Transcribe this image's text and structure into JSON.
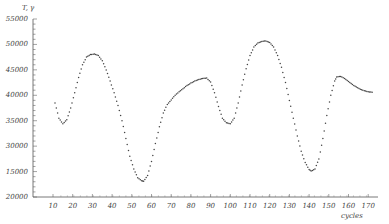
{
  "chart_data": {
    "type": "scatter",
    "title": "",
    "ylabel": "T, γ",
    "xlabel": "cycles",
    "xlim": [
      5,
      175
    ],
    "ylim": [
      20000,
      55000
    ],
    "grid": false,
    "legend": null,
    "x_ticks": [
      10,
      20,
      30,
      40,
      50,
      60,
      70,
      80,
      90,
      100,
      110,
      120,
      130,
      140,
      150,
      160,
      170
    ],
    "y_ticks": [
      20000,
      25000,
      30000,
      35000,
      40000,
      45000,
      50000,
      55000
    ],
    "y_tick_labels": [
      "20000",
      "15000",
      "30000",
      "35000",
      "40000",
      "45000",
      "50000",
      "55000"
    ],
    "series": [
      {
        "name": "observations",
        "marker": "dot",
        "x": [
          11,
          13,
          15,
          17,
          19,
          21,
          23,
          25,
          27,
          29,
          31,
          33,
          35,
          37,
          39,
          41,
          43,
          45,
          47,
          49,
          51,
          53,
          55,
          56,
          58,
          60,
          62,
          64,
          66,
          68,
          70,
          72,
          74,
          76,
          78,
          80,
          82,
          84,
          86,
          88,
          90,
          92,
          94,
          96,
          98,
          100,
          102,
          104,
          106,
          108,
          110,
          112,
          114,
          116,
          118,
          120,
          122,
          124,
          126,
          128,
          130,
          132,
          134,
          136,
          138,
          140,
          141,
          143,
          145,
          147,
          149,
          151,
          153,
          154,
          156,
          158,
          160,
          162,
          164,
          166,
          168,
          170,
          172
        ],
        "y": [
          38500,
          35500,
          34400,
          35200,
          37500,
          40500,
          43500,
          46000,
          47500,
          48000,
          48100,
          47800,
          46800,
          45000,
          42800,
          40500,
          38000,
          35000,
          31500,
          28000,
          25500,
          23800,
          23200,
          23100,
          24200,
          27000,
          30500,
          33800,
          36500,
          38200,
          39100,
          40000,
          40700,
          41300,
          41900,
          42400,
          42800,
          43100,
          43300,
          43400,
          42600,
          40500,
          37800,
          35500,
          34600,
          34400,
          35500,
          38500,
          42000,
          45200,
          47800,
          49500,
          50300,
          50600,
          50700,
          50400,
          49500,
          47800,
          45500,
          42500,
          39000,
          35500,
          32000,
          29000,
          26800,
          25400,
          25100,
          25500,
          27500,
          31500,
          36000,
          40000,
          42800,
          43600,
          43700,
          43300,
          42700,
          42100,
          41600,
          41200,
          40900,
          40700,
          40600
        ]
      }
    ]
  },
  "axes": {
    "y_unit_label": "T, γ",
    "x_unit_label": "cycles"
  }
}
